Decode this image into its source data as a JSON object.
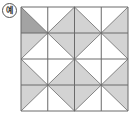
{
  "label": "예",
  "grid": {
    "rows": 4,
    "cols": 4,
    "x0": 21,
    "y0": 7,
    "x1": 128,
    "y1": 111,
    "colors": {
      "line": "#6a6a6a",
      "shade": "#d3d3d3",
      "highlight": "#a3a3a3",
      "background": "#ffffff"
    },
    "cells": [
      [
        {
          "diag": "tlbr",
          "shade": "bl",
          "highlight": true
        },
        {
          "diag": "bltr",
          "shade": "br"
        },
        {
          "diag": "tlbr",
          "shade": "bl"
        },
        {
          "diag": "bltr",
          "shade": "br"
        }
      ],
      [
        {
          "diag": "bltr",
          "shade": "tl"
        },
        {
          "diag": "tlbr",
          "shade": "tr"
        },
        {
          "diag": "bltr",
          "shade": "tl"
        },
        {
          "diag": "tlbr",
          "shade": "tr"
        }
      ],
      [
        {
          "diag": "tlbr",
          "shade": "bl"
        },
        {
          "diag": "bltr",
          "shade": "br"
        },
        {
          "diag": "tlbr",
          "shade": "bl"
        },
        {
          "diag": "bltr",
          "shade": "br"
        }
      ],
      [
        {
          "diag": "bltr",
          "shade": "tl"
        },
        {
          "diag": "tlbr",
          "shade": "tr"
        },
        {
          "diag": "bltr",
          "shade": "tl"
        },
        {
          "diag": "tlbr",
          "shade": "tr"
        }
      ]
    ]
  }
}
